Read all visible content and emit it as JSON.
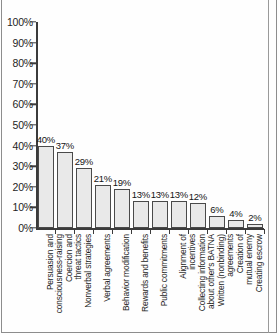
{
  "chart_data": {
    "type": "bar",
    "title": "",
    "xlabel": "",
    "ylabel": "",
    "ylim": [
      0,
      100
    ],
    "grid": false,
    "legend": "none",
    "y_tick_labels": [
      "100%",
      "90%",
      "80%",
      "70%",
      "60%",
      "50%",
      "40%",
      "30%",
      "20%",
      "10%",
      "0%"
    ],
    "y_tick_values": [
      100,
      90,
      80,
      70,
      60,
      50,
      40,
      30,
      20,
      10,
      0
    ],
    "categories": [
      "Persuasion and consciousness-raising",
      "Coercion and threat tactics",
      "Nonverbal strategies",
      "Verbal agreements",
      "Behavior modification",
      "Rewards and benefits",
      "Public commitments",
      "Alignment of incentives",
      "Collecting information about other's BATNA",
      "Written (nonbinding) agreements",
      "Creation of mutual enemy",
      "Creating escrow"
    ],
    "category_lines": [
      [
        "Persuasion and",
        "consciousness-raising"
      ],
      [
        "Coercion and",
        "threat tactics"
      ],
      [
        "Nonverbal strategies",
        ""
      ],
      [
        "Verbal agreements",
        ""
      ],
      [
        "Behavior modification",
        ""
      ],
      [
        "Rewards and benefits",
        ""
      ],
      [
        "Public commitments",
        ""
      ],
      [
        "Alignment of",
        "incentives"
      ],
      [
        "Collecting information",
        "about other's BATNA"
      ],
      [
        "Written (nonbinding)",
        "agreements"
      ],
      [
        "Creation of",
        "mutual enemy"
      ],
      [
        "Creating escrow",
        ""
      ]
    ],
    "values": [
      40,
      37,
      29,
      21,
      19,
      13,
      13,
      13,
      12,
      6,
      4,
      2
    ],
    "data_labels": [
      "40%",
      "37%",
      "29%",
      "21%",
      "19%",
      "13%",
      "13%",
      "13%",
      "12%",
      "6%",
      "4%",
      "2%"
    ]
  },
  "style": {
    "bar_fill": "#e9e9e9",
    "bar_stroke": "#4a4a4a",
    "axis_color": "#3b3b3b",
    "text_color": "#1c1c1c",
    "background": "#fefefe",
    "frame_color": "#8d8d8d"
  }
}
